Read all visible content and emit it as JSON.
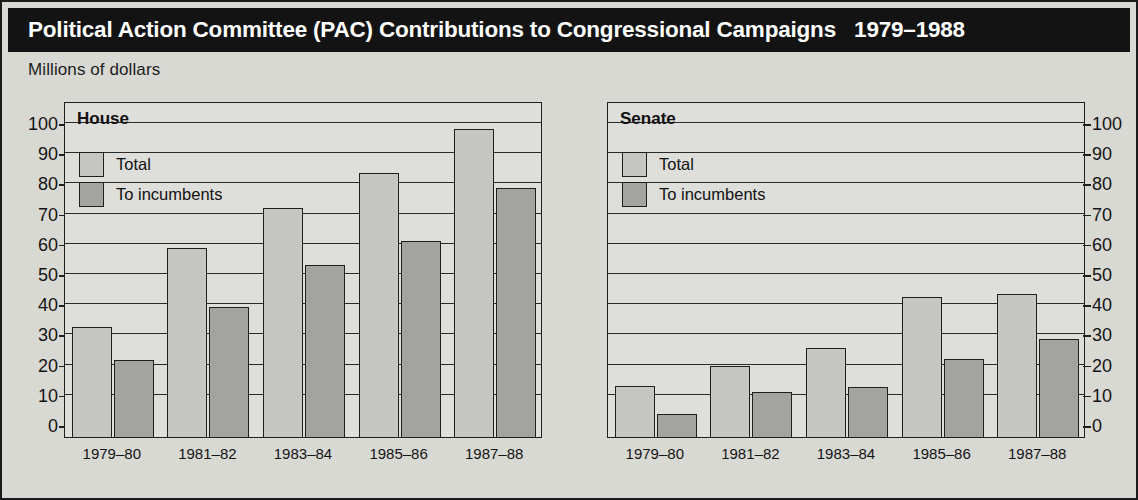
{
  "header": {
    "title": "Political Action Committee (PAC) Contributions to Congressional Campaigns   1979–1988",
    "subtitle": "Millions of dollars"
  },
  "legend": {
    "total_label": "Total",
    "incumbents_label": "To incumbents"
  },
  "colors": {
    "title_bar_background": "#131313",
    "title_text": "#ffffff",
    "page_background": "#d9d9d4",
    "plot_background": "#dededa",
    "total_bar": "#c6c6c2",
    "incumbents_bar": "#a3a3a0",
    "axis_line": "#1f1f1f"
  },
  "panels": {
    "house": {
      "title": "House"
    },
    "senate": {
      "title": "Senate"
    }
  },
  "axis": {
    "y_ticks": [
      "100",
      "90",
      "80",
      "70",
      "60",
      "50",
      "40",
      "30",
      "20",
      "10",
      "0"
    ],
    "x_categories": [
      "1979–80",
      "1981–82",
      "1983–84",
      "1985–86",
      "1987–88"
    ]
  },
  "chart_data": [
    {
      "type": "bar",
      "title": "House",
      "subtitle": "Millions of dollars",
      "categories": [
        "1979–80",
        "1981–82",
        "1983–84",
        "1985–86",
        "1987–88"
      ],
      "series": [
        {
          "name": "Total",
          "values": [
            36,
            62,
            75.5,
            87,
            101.5
          ]
        },
        {
          "name": "To incumbents",
          "values": [
            25,
            42.5,
            56.5,
            64.5,
            82
          ]
        }
      ],
      "xlabel": "",
      "ylabel": "Millions of dollars",
      "ylim": [
        0,
        100
      ],
      "ytick_step": 10,
      "grid": true,
      "legend_position": "top-left"
    },
    {
      "type": "bar",
      "title": "Senate",
      "subtitle": "Millions of dollars",
      "categories": [
        "1979–80",
        "1981–82",
        "1983–84",
        "1985–86",
        "1987–88"
      ],
      "series": [
        {
          "name": "Total",
          "values": [
            16.5,
            23,
            29,
            46,
            47
          ]
        },
        {
          "name": "To incumbents",
          "values": [
            7,
            14.5,
            16,
            25.5,
            32
          ]
        }
      ],
      "xlabel": "",
      "ylabel": "Millions of dollars",
      "ylim": [
        0,
        100
      ],
      "ytick_step": 10,
      "grid": true,
      "legend_position": "top-left"
    }
  ]
}
